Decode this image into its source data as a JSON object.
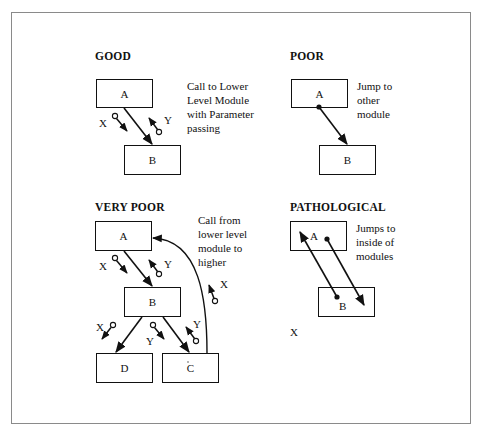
{
  "panels": {
    "good": {
      "title": "GOOD",
      "note": [
        "Call to Lower",
        "Level Module",
        "with Parameter",
        "passing"
      ],
      "modules": {
        "a": "A",
        "b": "B"
      },
      "params": {
        "x": "X",
        "y": "Y"
      }
    },
    "poor": {
      "title": "POOR",
      "note": [
        "Jump to",
        "other",
        "module"
      ],
      "modules": {
        "a": "A",
        "b": "B"
      }
    },
    "very_poor": {
      "title": "VERY POOR",
      "note": [
        "Call from",
        "lower level",
        "module to",
        "higher"
      ],
      "modules": {
        "a": "A",
        "b": "B",
        "c": "C",
        "d": "D"
      },
      "params": {
        "x_ab": "X",
        "y_ab": "Y",
        "x_bd": "X",
        "y_bc_down": "Y",
        "y_bc_up": "Y",
        "x_ca": "X"
      }
    },
    "pathological": {
      "title": "PATHOLOGICAL",
      "note": [
        "Jumps to",
        "inside of",
        "modules"
      ],
      "modules": {
        "a": "A",
        "b": "B"
      },
      "extra_label": "X"
    }
  },
  "colors": {
    "line": "#111111",
    "frame": "#8a8a8a",
    "background": "#ffffff"
  }
}
